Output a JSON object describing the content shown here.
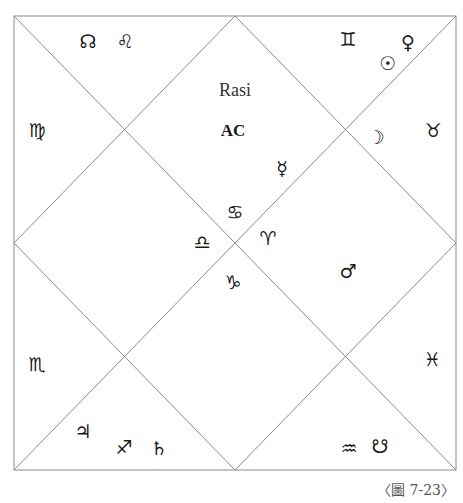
{
  "chart": {
    "title": "Rasi",
    "ascendant_label": "AC",
    "caption": "〈圖 7-23〉",
    "line_color": "#8a8a8a",
    "frame": {
      "x1": 14,
      "y1": 16,
      "x2": 456,
      "y2": 470
    }
  },
  "houses": [
    {
      "position": "top-center",
      "sign": "♋",
      "sign_name": "cancer",
      "planets": [
        {
          "glyph": "☿",
          "name": "mercury"
        }
      ],
      "label_main": "Rasi",
      "label_sub": "AC"
    },
    {
      "position": "top-left",
      "sign": "♌",
      "sign_name": "leo",
      "planets": [
        {
          "glyph": "☊",
          "name": "rahu-north-node"
        }
      ]
    },
    {
      "position": "left-upper",
      "sign": "♍",
      "sign_name": "virgo",
      "planets": []
    },
    {
      "position": "left-center",
      "sign": "♎",
      "sign_name": "libra",
      "planets": []
    },
    {
      "position": "left-lower",
      "sign": "♏",
      "sign_name": "scorpio",
      "planets": []
    },
    {
      "position": "bottom-left",
      "sign": "♐",
      "sign_name": "sagittarius",
      "planets": [
        {
          "glyph": "♃",
          "name": "jupiter"
        },
        {
          "glyph": "♄",
          "name": "saturn"
        }
      ]
    },
    {
      "position": "bottom-center",
      "sign": "♑",
      "sign_name": "capricorn",
      "planets": []
    },
    {
      "position": "bottom-right",
      "sign": "♒",
      "sign_name": "aquarius",
      "planets": [
        {
          "glyph": "☋",
          "name": "ketu-south-node"
        }
      ]
    },
    {
      "position": "right-lower",
      "sign": "♓",
      "sign_name": "pisces",
      "planets": []
    },
    {
      "position": "right-center",
      "sign": "♈",
      "sign_name": "aries",
      "planets": [
        {
          "glyph": "♂",
          "name": "mars"
        }
      ]
    },
    {
      "position": "right-upper",
      "sign": "♉",
      "sign_name": "taurus",
      "planets": [
        {
          "glyph": "☽",
          "name": "moon"
        }
      ]
    },
    {
      "position": "top-right",
      "sign": "♊",
      "sign_name": "gemini",
      "planets": [
        {
          "glyph": "☉",
          "name": "sun"
        },
        {
          "glyph": "♀",
          "name": "venus"
        }
      ]
    }
  ],
  "glyphs": {
    "rahu": "☊",
    "leo": "♌",
    "gemini": "♊",
    "sun": "☉",
    "venus": "♀",
    "virgo": "♍",
    "moon": "☽",
    "taurus": "♉",
    "mercury": "☿",
    "cancer": "♋",
    "libra": "♎",
    "aries": "♈",
    "capricorn": "♑",
    "mars": "♂",
    "scorpio": "♏",
    "pisces": "♓",
    "jupiter": "♃",
    "sagittarius": "♐",
    "saturn": "♄",
    "aquarius": "♒",
    "ketu": "☋"
  }
}
